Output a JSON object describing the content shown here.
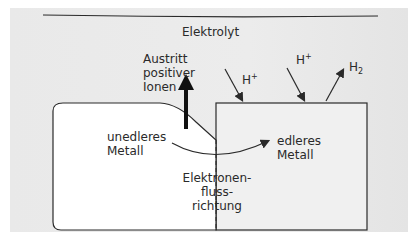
{
  "diagram": {
    "electrolyte_label": "Elektrolyt",
    "ion_exit_label": [
      "Austritt",
      "positiver",
      "Ionen"
    ],
    "base_metal_label": [
      "unedleres",
      "Metall"
    ],
    "noble_metal_label": [
      "edleres",
      "Metall"
    ],
    "electron_flow_label": [
      "Elektronen-",
      "fluss-",
      "richtung"
    ],
    "species": {
      "h_plus_1": "H",
      "h_plus_1_sup": "+",
      "h_plus_2": "H",
      "h_plus_2_sup": "+",
      "h2": "H",
      "h2_sub": "2"
    }
  },
  "colors": {
    "background": "#eaeaea",
    "metal_fill": "#ffffff",
    "line": "#2a2a2a"
  }
}
